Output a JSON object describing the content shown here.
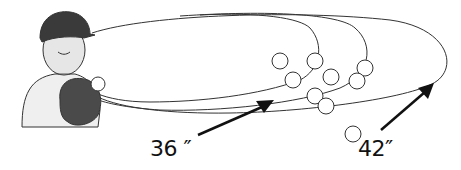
{
  "figure": {
    "labels": [
      {
        "id": "short",
        "text": "36 ″"
      },
      {
        "id": "long",
        "text": "42″"
      }
    ],
    "elements": {
      "person": "boy-with-baseball-cap-and-glove",
      "trajectories": "ball-flight-paths",
      "balls": [
        {
          "cx": 280,
          "cy": 61
        },
        {
          "cx": 315,
          "cy": 61
        },
        {
          "cx": 293,
          "cy": 80
        },
        {
          "cx": 331,
          "cy": 77
        },
        {
          "cx": 365,
          "cy": 68
        },
        {
          "cx": 357,
          "cy": 81
        },
        {
          "cx": 315,
          "cy": 96
        },
        {
          "cx": 326,
          "cy": 106
        },
        {
          "cx": 353,
          "cy": 134
        }
      ]
    },
    "colors": {
      "line": "#222222",
      "cap": "#3a3a3a",
      "glove": "#4a4a4a",
      "skin": "#e2e2e2",
      "shirt": "#efefef"
    }
  }
}
